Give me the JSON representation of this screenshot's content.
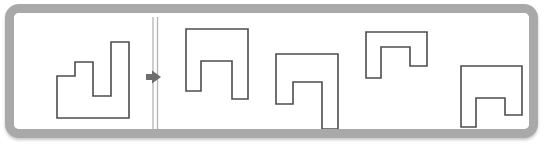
{
  "figure": {
    "kind": "visual-analogy-puzzle",
    "title_text": "",
    "frame": {
      "border_color": "#a9a9a9",
      "background_color": "#ffffff",
      "corner_radius": "14px"
    },
    "stroke_color": "#4d4d4d",
    "fill_color": "#ffffff",
    "divider": {
      "name": "double-vertical-divider",
      "color": "#b3b3b3",
      "x_positions": [
        148,
        152
      ],
      "y_top": 13,
      "y_bottom": 128
    },
    "arrow": {
      "name": "right-arrow-icon",
      "color": "#6e6e6e",
      "center_x": 150,
      "center_y": 73,
      "direction": "right"
    }
  },
  "prompt_panel": {
    "label": "query-shape-panel",
    "shape": {
      "name": "stepped-block-shape",
      "points": "52,72 52,114 124,114 124,38 106,38 106,92 88,92 88,58 70,58 70,72",
      "description": "stepped polygon with tall right column"
    }
  },
  "answer_panel": {
    "label": "candidate-shapes-panel",
    "options": [
      {
        "id": "option-1",
        "name": "arch-shape-notched-1",
        "points": "181,25 181,87 196,87 196,57 227,57 227,95 243,95 243,25",
        "description": "wide arch with offset inner notch"
      },
      {
        "id": "option-2",
        "name": "arch-shape-notched-2",
        "points": "271,50 271,100 288,100 288,78 317,78 317,125 333,125 333,50",
        "description": "arch with tall right leg"
      },
      {
        "id": "option-3",
        "name": "arch-shape-notched-3",
        "points": "361,28 361,74 376,74 376,43 405,43 405,62 422,62 422,28",
        "description": "short wide arch with shallow notch"
      },
      {
        "id": "option-4",
        "name": "arch-shape-notched-4",
        "points": "456,62 456,123 471,123 471,94 500,94 500,111 517,111 517,62",
        "description": "arch with deep left leg"
      }
    ]
  }
}
